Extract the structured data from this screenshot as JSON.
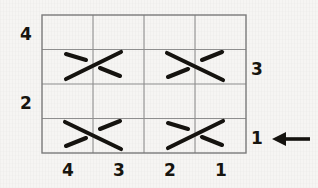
{
  "figure": {
    "background_color": "#f6f5f3",
    "ink_color": "#15130f",
    "grid_color": "#8e8e8e",
    "grid": {
      "columns": 4,
      "rows": 4,
      "x_left": 42,
      "x_right": 246,
      "y_top": 15,
      "y_bottom": 153
    }
  },
  "labels": {
    "left": [
      {
        "text": "4",
        "row": 1,
        "x": 26,
        "y": 40
      },
      {
        "text": "2",
        "row": 3,
        "x": 26,
        "y": 109
      }
    ],
    "right": [
      {
        "text": "3",
        "row": 2,
        "x": 257,
        "y": 75
      },
      {
        "text": "1",
        "row": 4,
        "x": 257,
        "y": 144
      }
    ],
    "bottom": [
      {
        "text": "4",
        "column": 1,
        "x": 68,
        "y": 176
      },
      {
        "text": "3",
        "column": 2,
        "x": 119,
        "y": 176
      },
      {
        "text": "2",
        "column": 3,
        "x": 170,
        "y": 176
      },
      {
        "text": "1",
        "column": 4,
        "x": 221,
        "y": 176
      }
    ]
  },
  "arrow": {
    "name": "left-pointing-arrow",
    "direction": "left",
    "points_to_row": 4,
    "tip_x": 275,
    "tail_x": 310,
    "y": 139
  },
  "crossings": [
    {
      "id": "crossing-row2-left",
      "row": 2,
      "columns": [
        1,
        2
      ],
      "over_strand": "bottom-left-to-top-right",
      "under_strand": "top-left-to-bottom-right",
      "center_x": 93,
      "center_y": 64
    },
    {
      "id": "crossing-row2-right",
      "row": 2,
      "columns": [
        3,
        4
      ],
      "over_strand": "top-left-to-bottom-right",
      "under_strand": "bottom-left-to-top-right",
      "center_x": 195,
      "center_y": 64
    },
    {
      "id": "crossing-row4-left",
      "row": 4,
      "columns": [
        1,
        2
      ],
      "over_strand": "top-left-to-bottom-right",
      "under_strand": "bottom-left-to-top-right",
      "center_x": 93,
      "center_y": 133
    },
    {
      "id": "crossing-row4-right",
      "row": 4,
      "columns": [
        3,
        4
      ],
      "over_strand": "bottom-left-to-top-right",
      "under_strand": "top-left-to-bottom-right",
      "center_x": 195,
      "center_y": 133
    }
  ]
}
